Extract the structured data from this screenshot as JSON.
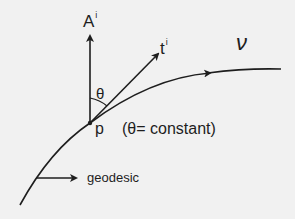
{
  "diagram": {
    "vectors": {
      "A": {
        "label": "A",
        "superscript": "i"
      },
      "t": {
        "label": "t",
        "superscript": "i"
      }
    },
    "angle_label": "θ",
    "point_label": "p",
    "curve_label": "ν",
    "condition": "(θ= constant)",
    "geodesic_label": "geodesic",
    "colors": {
      "ink": "#1e1e1e",
      "background": "#f1f1f1"
    }
  }
}
